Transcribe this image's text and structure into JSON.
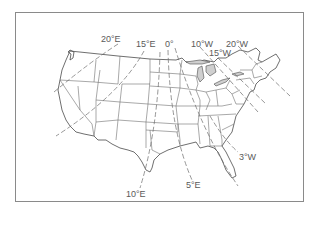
{
  "map": {
    "subject": "Contiguous United States isogonic lines (magnetic declination)",
    "frame_color": "#8a8a8a",
    "line_color": "#6a6a6a",
    "label_color": "#5a5a5a",
    "isogonic_lines": [
      {
        "id": "20E",
        "label": "20°E"
      },
      {
        "id": "15E",
        "label": "15°E"
      },
      {
        "id": "0",
        "label": "0°"
      },
      {
        "id": "10W",
        "label": "10°W"
      },
      {
        "id": "20W",
        "label": "20°W"
      },
      {
        "id": "15W",
        "label": "15°W"
      },
      {
        "id": "10E",
        "label": "10°E"
      },
      {
        "id": "5E",
        "label": "5°E"
      },
      {
        "id": "3W",
        "label": "3°W"
      }
    ]
  }
}
